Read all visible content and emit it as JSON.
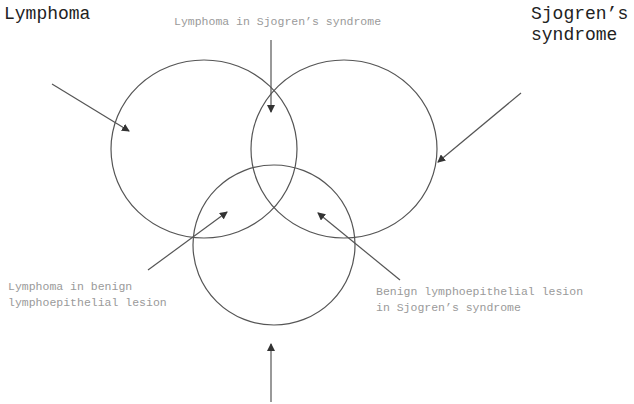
{
  "labels": {
    "lymphoma": "Lymphoma",
    "sjogrens_line1": "Sjogren’s",
    "sjogrens_line2": "syndrome",
    "lymphoma_in_sjogrens": "Lymphoma in Sjogren’s syndrome",
    "lymphoma_in_benign_line1": "Lymphoma in benign",
    "lymphoma_in_benign_line2": "lymphoepithelial lesion",
    "benign_in_sjogrens_line1": "Benign lymphoepithelial lesion",
    "benign_in_sjogrens_line2": "in Sjogren’s syndrome"
  },
  "colors": {
    "stroke": "#555555",
    "label_primary": "#222222",
    "label_secondary": "#9a9a9a"
  },
  "circles": [
    {
      "name": "lymphoma",
      "cx": 204,
      "cy": 149,
      "rx": 93,
      "ry": 89
    },
    {
      "name": "sjogrens-syndrome",
      "cx": 344,
      "cy": 149,
      "rx": 93,
      "ry": 89
    },
    {
      "name": "benign-lymphoepithelial-lesion",
      "cx": 274,
      "cy": 245,
      "rx": 81,
      "ry": 80
    }
  ]
}
